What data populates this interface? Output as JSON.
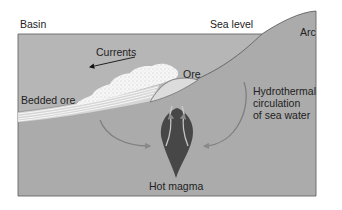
{
  "labels": {
    "basin": "Basin",
    "sea_level": "Sea level",
    "arc": "Arc",
    "currents": "Currents",
    "ore": "Ore",
    "bedded_ore": "Bedded ore",
    "hydrothermal": "Hydrothermal\ncirculation\nof sea water",
    "hot_magma": "Hot magma"
  },
  "colors": {
    "sea": "#b4b4b4",
    "land": "#a9a9a9",
    "sediment": "#f4f4f4",
    "ore_mound": "#d8d8d8",
    "magma": "#4a4a4a",
    "arrow": "#7a7a7a",
    "outline": "#555555"
  }
}
